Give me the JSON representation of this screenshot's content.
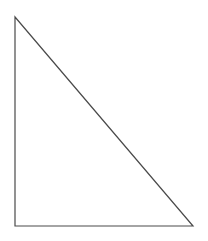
{
  "canvas": {
    "width": 208,
    "height": 241,
    "background_color": "#ffffff"
  },
  "figure": {
    "name": "right-triangle",
    "fill": "none",
    "stroke_color": "#4a4a4a",
    "stroke_width": 1.2,
    "vertices": [
      {
        "label": "top-left",
        "x": 15,
        "y": 17
      },
      {
        "label": "bottom-left",
        "x": 15,
        "y": 226
      },
      {
        "label": "bottom-right",
        "x": 193,
        "y": 226
      }
    ],
    "points_attr": "15,17 15,226 193,226",
    "edges": [
      {
        "name": "vertical-leg",
        "from": "top-left",
        "to": "bottom-left"
      },
      {
        "name": "horizontal-leg",
        "from": "bottom-left",
        "to": "bottom-right"
      },
      {
        "name": "hypotenuse",
        "from": "bottom-right",
        "to": "top-left"
      }
    ]
  }
}
